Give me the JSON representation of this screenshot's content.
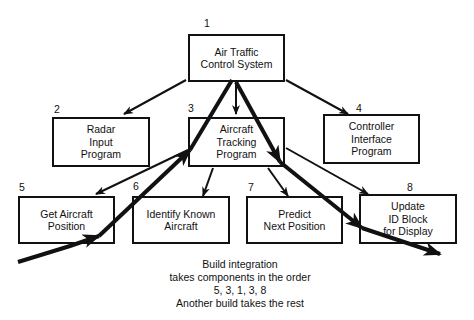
{
  "nodes": [
    {
      "id": "1",
      "number": "1",
      "label": "Air Traffic\nControl System"
    },
    {
      "id": "2",
      "number": "2",
      "label": "Radar\nInput\nProgram"
    },
    {
      "id": "3",
      "number": "3",
      "label": "Aircraft\nTracking\nProgram"
    },
    {
      "id": "4",
      "number": "4",
      "label": "Controller\nInterface\nProgram"
    },
    {
      "id": "5",
      "number": "5",
      "label": "Get Aircraft\nPosition"
    },
    {
      "id": "6",
      "number": "6",
      "label": "Identify Known\nAircraft"
    },
    {
      "id": "7",
      "number": "7",
      "label": "Predict\nNext Position"
    },
    {
      "id": "8",
      "number": "8",
      "label": "Update\nID Block\nfor Display"
    }
  ],
  "edges": [
    {
      "from": "1",
      "to": "2"
    },
    {
      "from": "1",
      "to": "3"
    },
    {
      "from": "1",
      "to": "4"
    },
    {
      "from": "3",
      "to": "5"
    },
    {
      "from": "3",
      "to": "6"
    },
    {
      "from": "3",
      "to": "7"
    },
    {
      "from": "3",
      "to": "8"
    }
  ],
  "build_path": [
    "5",
    "3",
    "1",
    "3",
    "8"
  ],
  "caption": "Build integration\ntakes components in the order\n5, 3, 1, 3, 8\nAnother build takes the rest"
}
